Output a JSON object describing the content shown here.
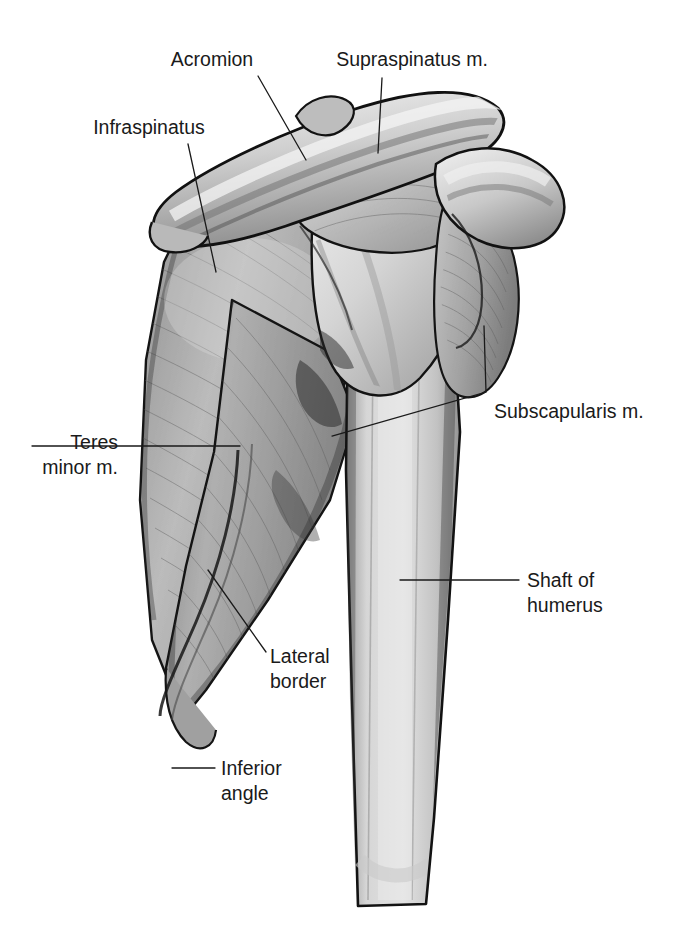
{
  "figure": {
    "background_color": "#ffffff",
    "ink_color": "#1a1a1a",
    "width": 676,
    "height": 933
  },
  "labels": [
    {
      "id": "acromion",
      "text": "Acromion",
      "lines": [
        "Acromion"
      ],
      "text_x": 212,
      "text_y": 66,
      "anchor": "middle",
      "leader": "M 258 76 L 306 160",
      "structure": "acromion"
    },
    {
      "id": "supraspinatus",
      "text": "Supraspinatus m.",
      "lines": [
        "Supraspinatus m."
      ],
      "text_x": 412,
      "text_y": 66,
      "anchor": "middle",
      "leader": "M 382 78 L 378 153",
      "structure": "supraspinatus-muscle"
    },
    {
      "id": "infraspinatus",
      "text": "Infraspinatus",
      "lines": [
        "Infraspinatus"
      ],
      "text_x": 149,
      "text_y": 134,
      "anchor": "middle",
      "leader": "M 188 144 L 216 272",
      "structure": "infraspinatus-muscle"
    },
    {
      "id": "subscapularis",
      "text": "Subscapularis m.",
      "lines": [
        "Subscapularis m."
      ],
      "text_x": 494,
      "text_y": 418,
      "anchor": "start",
      "leader": "M 484 326 L 486 392 L 332 436",
      "structure": "subscapularis-muscle"
    },
    {
      "id": "teres-minor",
      "text": "Teres minor m.",
      "lines": [
        "Teres",
        "minor m."
      ],
      "text_x": 118,
      "text_y": 449,
      "anchor": "end",
      "leader": "M 32 446 L 240 446",
      "structure": "teres-minor-muscle"
    },
    {
      "id": "shaft-of-humerus",
      "text": "Shaft of humerus",
      "lines": [
        "Shaft of",
        "humerus"
      ],
      "text_x": 527,
      "text_y": 587,
      "anchor": "start",
      "leader": "M 519 580 L 400 580",
      "structure": "humerus-shaft"
    },
    {
      "id": "lateral-border",
      "text": "Lateral border",
      "lines": [
        "Lateral",
        "border"
      ],
      "text_x": 270,
      "text_y": 663,
      "anchor": "start",
      "leader": "M 266 652 L 208 570",
      "structure": "scapula-lateral-border"
    },
    {
      "id": "inferior-angle",
      "text": "Inferior angle",
      "lines": [
        "Inferior",
        "angle"
      ],
      "text_x": 221,
      "text_y": 775,
      "anchor": "start",
      "leader": "M 215 768 L 172 768",
      "structure": "scapula-inferior-angle"
    }
  ],
  "structures": [
    {
      "id": "acromion",
      "name": "Acromion",
      "tone": "#c9c9c9"
    },
    {
      "id": "supraspinatus-muscle",
      "name": "Supraspinatus m.",
      "tone": "#d2d2d2"
    },
    {
      "id": "infraspinatus-muscle",
      "name": "Infraspinatus",
      "tone": "#b4b4b4"
    },
    {
      "id": "teres-minor-muscle",
      "name": "Teres minor m.",
      "tone": "#a6a6a6"
    },
    {
      "id": "subscapularis-muscle",
      "name": "Subscapularis m.",
      "tone": "#b8b8b8"
    },
    {
      "id": "humerus-shaft",
      "name": "Shaft of humerus",
      "tone": "#cfcfcf"
    },
    {
      "id": "scapula-lateral-border",
      "name": "Lateral border",
      "tone": "#9e9e9e"
    },
    {
      "id": "scapula-inferior-angle",
      "name": "Inferior angle",
      "tone": "#a8a8a8"
    },
    {
      "id": "humeral-head",
      "name": "Head of humerus",
      "tone": "#d8d8d8"
    },
    {
      "id": "clavicle",
      "name": "Clavicle / distal fragment",
      "tone": "#cccccc"
    }
  ]
}
